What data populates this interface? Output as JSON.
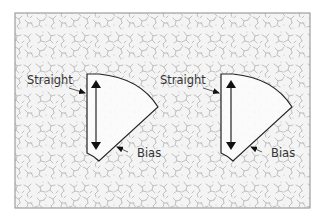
{
  "diagram": {
    "colors": {
      "background": "#ffffff",
      "fabric_pattern": "#a8a8a8",
      "frame": "#888888",
      "piece_fill": "#fbfbfb",
      "outline": "#222222",
      "text": "#333333"
    },
    "pieces": [
      {
        "id": "left",
        "labels": {
          "straight": "Straight",
          "bias": "Bias"
        },
        "grain_arrow": "double-headed vertical arrow"
      },
      {
        "id": "right",
        "labels": {
          "straight": "Straight",
          "bias": "Bias"
        },
        "grain_arrow": "double-headed vertical arrow"
      }
    ]
  }
}
